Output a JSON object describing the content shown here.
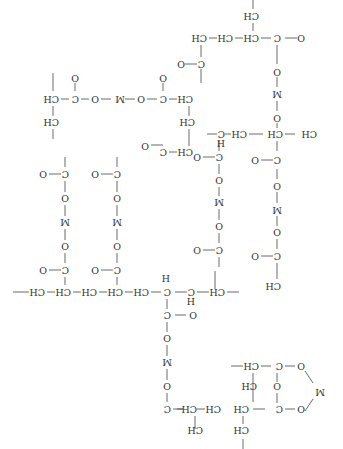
{
  "diagram": {
    "type": "chemical-structure",
    "orientation": "rotated-180",
    "atom_labels": [
      "CH",
      "CH2",
      "C",
      "O",
      "M",
      "H"
    ],
    "bridge_unit": "C(=O)-O-M-O-C(=O)",
    "metal_symbol": "M",
    "bridge_count": 7,
    "text_color": "#333333",
    "line_color": "#444444"
  },
  "labels": {
    "ch": "CH",
    "ch2": "CH",
    "sub2": "2",
    "c": "C",
    "o": "O",
    "m": "M",
    "h": "H",
    "dbl_o": "O"
  }
}
